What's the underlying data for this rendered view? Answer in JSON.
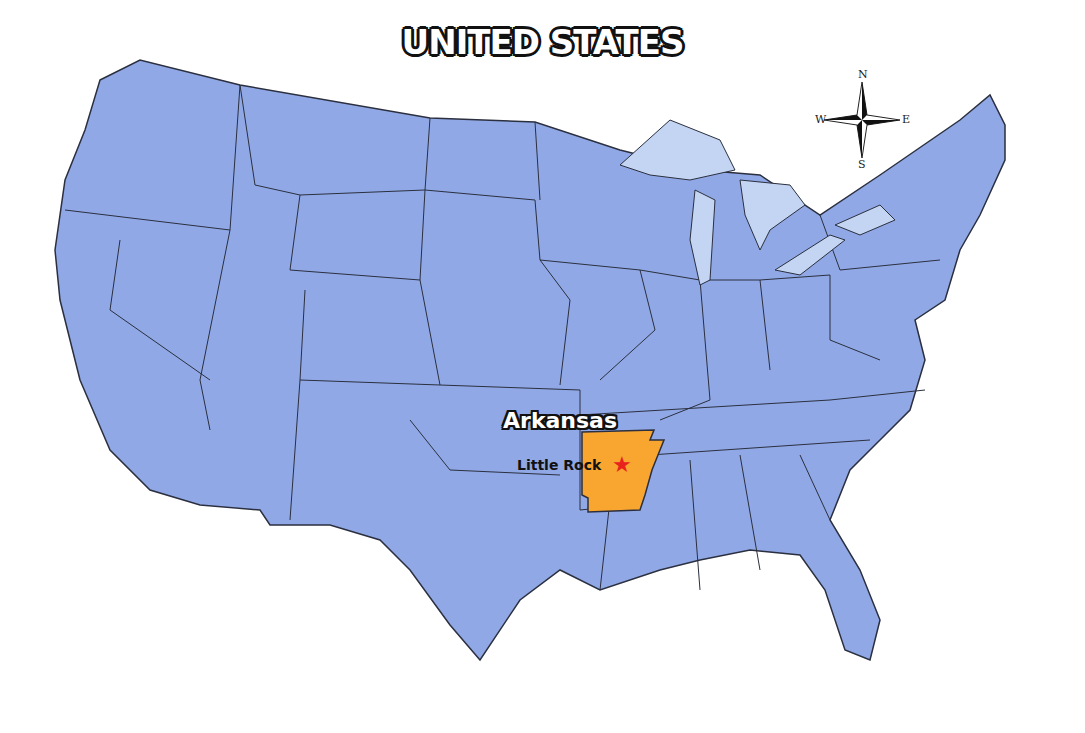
{
  "title": "UNITED STATES",
  "compass": {
    "north": "N",
    "south": "S",
    "east": "E",
    "west": "W"
  },
  "highlight": {
    "state": "Arkansas",
    "capital": "Little Rock",
    "capital_marker": "★"
  },
  "colors": {
    "states_fill": "#90a9e6",
    "state_border": "#2b2f3f",
    "great_lakes": "#c3d5f2",
    "highlight_fill": "#f8a630",
    "capital_star": "#e8221c",
    "background": "#ffffff"
  }
}
